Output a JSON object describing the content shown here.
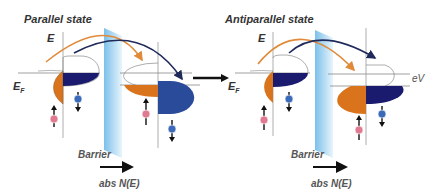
{
  "panels": [
    {
      "title": "Parallel state",
      "energy_axis": "E",
      "fermi_label": "E",
      "fermi_sub": "F",
      "barrier_label": "Barrier",
      "xaxis_label": "abs N(E)"
    },
    {
      "title": "Antiparallel state",
      "energy_axis": "E",
      "fermi_label": "E",
      "fermi_sub": "F",
      "barrier_label": "Barrier",
      "xaxis_label": "abs N(E)",
      "bias_label": "eV"
    }
  ],
  "colors": {
    "spin_up_band": "#d9741c",
    "spin_down_band": "#1a1a6e",
    "spin_down_band_light": "#2a4a9a",
    "barrier": "#a9d6f0",
    "arrow_orange": "#e08a3a",
    "arrow_navy": "#1f2a5a",
    "electron_up": "#e07a90",
    "electron_down": "#3a6ab8"
  }
}
